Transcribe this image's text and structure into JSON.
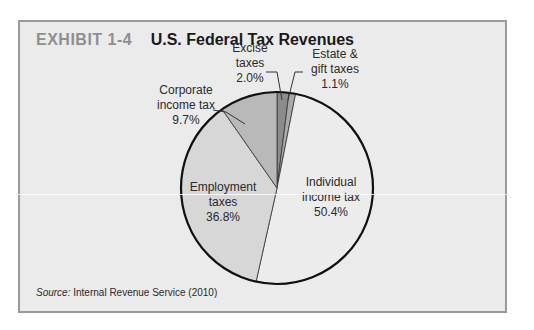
{
  "header": {
    "exhibit_label": "EXHIBIT 1-4",
    "title": "U.S. Federal Tax Revenues"
  },
  "source": {
    "prefix": "Source:",
    "text": "Internal Revenue Service (2010)"
  },
  "labels": {
    "excise": {
      "line1": "Excise",
      "line2": "taxes",
      "pct": "2.0%"
    },
    "estate": {
      "line1": "Estate &",
      "line2": "gift taxes",
      "pct": "1.1%"
    },
    "corporate": {
      "line1": "Corporate",
      "line2": "income tax",
      "pct": "9.7%"
    },
    "employment": {
      "line1": "Employment",
      "line2": "taxes",
      "pct": "36.8%"
    },
    "individual": {
      "line1": "Individual",
      "line2": "income tax",
      "pct": "50.4%"
    }
  },
  "colors": {
    "frame_bg": "#ebebeb",
    "frame_border": "#9a9a9a",
    "exhibit_label": "#8f8f8f",
    "outline": "#111111"
  },
  "chart_data": {
    "type": "pie",
    "title": "U.S. Federal Tax Revenues",
    "subtitle": "EXHIBIT 1-4",
    "categories": [
      "Excise taxes",
      "Estate & gift taxes",
      "Individual income tax",
      "Employment taxes",
      "Corporate income tax"
    ],
    "values": [
      2.0,
      1.1,
      50.4,
      36.8,
      9.7
    ],
    "unit": "%",
    "colors": [
      "#8c8c8c",
      "#a9a9a9",
      "#ececec",
      "#d7d7d7",
      "#b9b9b9"
    ],
    "start_angle_deg": 0,
    "direction": "clockwise",
    "legend": "none (direct labels with leader lines)",
    "source": "Internal Revenue Service (2010)"
  }
}
